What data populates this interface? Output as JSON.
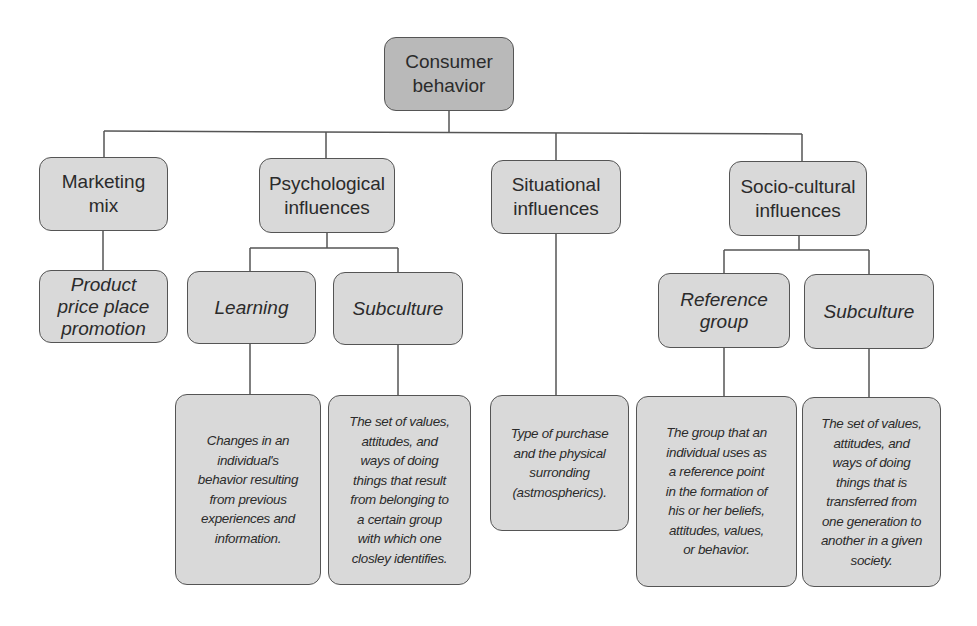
{
  "diagram": {
    "type": "hierarchy",
    "root": {
      "label": "Consumer behavior"
    },
    "level1": [
      {
        "id": "marketing-mix",
        "label": "Marketing\nmix"
      },
      {
        "id": "psychological",
        "label": "Psychological\ninfluences"
      },
      {
        "id": "situational",
        "label": "Situational\ninfluences"
      },
      {
        "id": "socio-cultural",
        "label": "Socio-cultural\ninfluences"
      }
    ],
    "level2": [
      {
        "id": "product",
        "parent": "marketing-mix",
        "label": "Product\nprice place\npromotion"
      },
      {
        "id": "learning",
        "parent": "psychological",
        "label": "Learning"
      },
      {
        "id": "subculture-psych",
        "parent": "psychological",
        "label": "Subculture"
      },
      {
        "id": "reference-group",
        "parent": "socio-cultural",
        "label": "Reference\ngroup"
      },
      {
        "id": "subculture-socio",
        "parent": "socio-cultural",
        "label": "Subculture"
      }
    ],
    "level3": [
      {
        "id": "learning-desc",
        "parent": "learning",
        "label": "Changes in an\nindividual's\nbehavior resulting\nfrom previous\nexperiences and\ninformation."
      },
      {
        "id": "subculture-psych-desc",
        "parent": "subculture-psych",
        "label": "The set of values,\nattitudes, and\nways of doing\nthings that result\nfrom belonging to\na certain group\nwith which one\nclosley identifies."
      },
      {
        "id": "situational-desc",
        "parent": "situational",
        "label": "Type of purchase\nand the physical\nsurronding\n(astmospherics)."
      },
      {
        "id": "reference-group-desc",
        "parent": "reference-group",
        "label": "The group that an\nindividual uses as\na reference point\nin the formation of\nhis or her beliefs,\nattitudes, values,\nor behavior."
      },
      {
        "id": "subculture-socio-desc",
        "parent": "subculture-socio",
        "label": "The set of values,\nattitudes, and\nways of doing\nthings that is\ntransferred from\none generation to\nanother in a given\nsociety."
      }
    ],
    "colors": {
      "root_fill": "#b9b9b9",
      "node_fill": "#d9d9d9",
      "stroke": "#555555"
    }
  }
}
